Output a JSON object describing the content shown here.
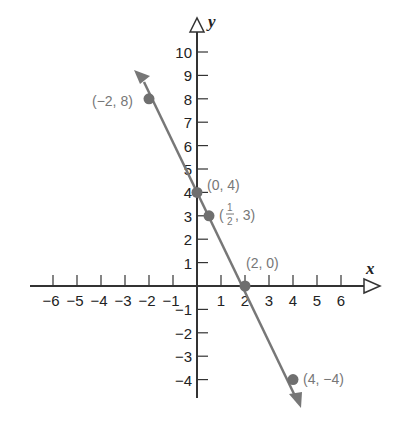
{
  "chart_data": {
    "type": "line",
    "title": "",
    "xlabel": "x",
    "ylabel": "y",
    "xlim": [
      -6.8,
      7.2
    ],
    "ylim": [
      -5,
      11
    ],
    "grid": false,
    "x_ticks": [
      -6,
      -5,
      -4,
      -3,
      -2,
      -1,
      1,
      2,
      3,
      4,
      5,
      6
    ],
    "y_ticks": [
      -4,
      -3,
      -2,
      -1,
      1,
      2,
      3,
      4,
      5,
      6,
      7,
      8,
      9,
      10
    ],
    "x_tick_labels": [
      "−6",
      "−5",
      "−4",
      "−3",
      "−2",
      "−1",
      "1",
      "2",
      "3",
      "4",
      "5",
      "6"
    ],
    "y_tick_labels": [
      "−4",
      "−3",
      "−2",
      "−1",
      "1",
      "2",
      "3",
      "4",
      "5",
      "6",
      "7",
      "8",
      "9",
      "10"
    ],
    "series": [
      {
        "name": "y = -2x + 4",
        "color": "#777777",
        "x": [
          -2,
          0,
          0.5,
          2,
          4
        ],
        "y": [
          8,
          4,
          3,
          0,
          -4
        ]
      }
    ],
    "points": [
      {
        "x": -2,
        "y": 8,
        "label": "(−2, 8)"
      },
      {
        "x": 0,
        "y": 4,
        "label": "(0, 4)"
      },
      {
        "x": 0.5,
        "y": 3,
        "label": "(1/2, 3)"
      },
      {
        "x": 2,
        "y": 0,
        "label": "(2, 0)"
      },
      {
        "x": 4,
        "y": -4,
        "label": "(4, −4)"
      }
    ]
  },
  "labels": {
    "x_axis": "x",
    "y_axis": "y",
    "p1": "(−2, 8)",
    "p2": "(0, 4)",
    "p3_open": "(",
    "p3_num": "1",
    "p3_den": "2",
    "p3_close": ", 3)",
    "p4": "(2, 0)",
    "p5": "(4, −4)"
  }
}
